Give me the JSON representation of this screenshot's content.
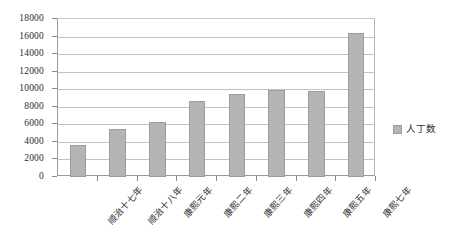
{
  "chart_data": {
    "type": "bar",
    "title": "",
    "subtitle": "",
    "xlabel": "",
    "ylabel": "",
    "categories": [
      "顺治十七年",
      "顺治十八年",
      "康熙元年",
      "康熙二年",
      "康熙三年",
      "康熙四年",
      "康熙五年",
      "康熙七年"
    ],
    "series": [
      {
        "name": "人丁数",
        "values": [
          3700,
          5500,
          6300,
          8700,
          9400,
          9900,
          9850,
          16400
        ]
      }
    ],
    "values": [
      3700,
      5500,
      6300,
      8700,
      9400,
      9900,
      9850,
      16400
    ],
    "ylim": [
      0,
      18000
    ],
    "y_tick_step": 2000,
    "y_ticks": [
      0,
      2000,
      4000,
      6000,
      8000,
      10000,
      12000,
      14000,
      16000,
      18000
    ],
    "y_tick_labels": [
      "0",
      "2000",
      "4000",
      "6000",
      "8000",
      "10000",
      "12000",
      "14000",
      "16000",
      "18000"
    ],
    "grid": true,
    "grid_axis": "y",
    "legend": {
      "position": "right",
      "entries": [
        "人丁数"
      ]
    },
    "colors": {
      "bar_fill": "#b4b4b4",
      "bar_border": "#9c9c9c",
      "gridline": "#c2c2c2",
      "axis": "#9a9a9a",
      "text": "#2b2b2b",
      "background": "#ffffff"
    }
  },
  "legend": {
    "swatch_color": "#b4b4b4",
    "label": "人丁数"
  }
}
